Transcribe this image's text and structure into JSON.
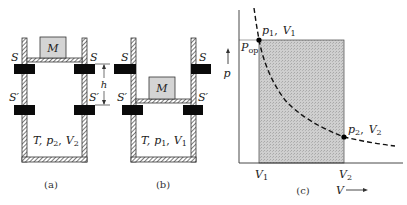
{
  "figure_a": {
    "caption": "(a)",
    "mass_label": "M",
    "stop_upper_label": "S",
    "stop_lower_label": "S′",
    "height_label": "h",
    "state_T": "T,",
    "state_p": "p",
    "state_p_sub": "2",
    "state_V": "V",
    "state_V_sub": "2"
  },
  "figure_b": {
    "caption": "(b)",
    "mass_label": "M",
    "stop_upper_label": "S",
    "stop_lower_label": "S′",
    "state_T": "T,",
    "state_p": "p",
    "state_p_sub": "1",
    "state_V": "V",
    "state_V_sub": "1"
  },
  "figure_c": {
    "caption": "(c)",
    "y_axis_label": "p",
    "x_axis_label": "V",
    "pop_label": "P",
    "pop_sub": "op",
    "point1_p": "p",
    "point1_p_sub": "1",
    "point1_V": "V",
    "point1_V_sub": "1",
    "point2_p": "p",
    "point2_p_sub": "2",
    "point2_V": "V",
    "point2_V_sub": "2",
    "tick_V1": "V",
    "tick_V1_sub": "1",
    "tick_V2": "V",
    "tick_V2_sub": "2"
  },
  "colors": {
    "line": "#222222",
    "stop_fill": "#0a0a0a",
    "mass_fill": "#d4d4d4",
    "shade_fill": "#c9c9c9"
  }
}
